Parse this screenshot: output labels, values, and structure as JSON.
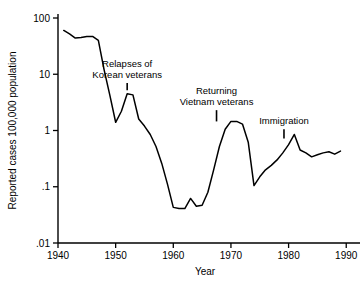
{
  "chart_data": {
    "type": "line",
    "title": "",
    "xlabel": "Year",
    "ylabel": "Reported cases 100,000 population",
    "xlim": [
      1940,
      1991
    ],
    "ylim": [
      0.01,
      100
    ],
    "yscale": "log",
    "grid": false,
    "legend": "none",
    "xticks": [
      "1940",
      "1950",
      "1960",
      "1970",
      "1980",
      "1990"
    ],
    "xtick_values": [
      1940,
      1950,
      1960,
      1970,
      1980,
      1990
    ],
    "yticks": [
      "100",
      "10",
      "1",
      ".1",
      ".01"
    ],
    "ytick_values": [
      100,
      10,
      1,
      0.1,
      0.01
    ],
    "series": [
      {
        "name": "Reported cases per 100,000 population",
        "x": [
          1941,
          1942,
          1943,
          1944,
          1945,
          1946,
          1947,
          1948,
          1949,
          1950,
          1951,
          1952,
          1953,
          1954,
          1955,
          1956,
          1957,
          1958,
          1959,
          1960,
          1961,
          1962,
          1963,
          1964,
          1965,
          1966,
          1967,
          1968,
          1969,
          1970,
          1971,
          1972,
          1973,
          1974,
          1975,
          1976,
          1977,
          1978,
          1979,
          1980,
          1981,
          1982,
          1983,
          1984,
          1985,
          1986,
          1987,
          1988,
          1989
        ],
        "y": [
          60,
          52,
          44,
          45,
          47,
          47,
          40,
          12,
          4.2,
          1.4,
          2.2,
          4.5,
          4.3,
          1.6,
          1.2,
          0.85,
          0.52,
          0.26,
          0.11,
          0.043,
          0.041,
          0.041,
          0.062,
          0.045,
          0.047,
          0.08,
          0.2,
          0.52,
          1.05,
          1.45,
          1.45,
          1.3,
          0.62,
          0.105,
          0.15,
          0.2,
          0.24,
          0.3,
          0.4,
          0.56,
          0.85,
          0.45,
          0.4,
          0.34,
          0.37,
          0.4,
          0.42,
          0.38,
          0.43
        ]
      }
    ],
    "annotations": [
      {
        "id": "korean",
        "lines": [
          "Relapses of",
          "Korean veterans"
        ],
        "pointer_x": 1952,
        "pointer_top_y": 7.0,
        "pointer_bottom_y": 5.2
      },
      {
        "id": "vietnam",
        "lines": [
          "Returning",
          "Vietnam veterans"
        ],
        "pointer_x": 1967.5,
        "pointer_top_y": 2.3,
        "pointer_bottom_y": 1.45
      },
      {
        "id": "immigration",
        "lines": [
          "Immigration"
        ],
        "pointer_x": 1979.2,
        "pointer_top_y": 1.05,
        "pointer_bottom_y": 0.72
      }
    ]
  }
}
